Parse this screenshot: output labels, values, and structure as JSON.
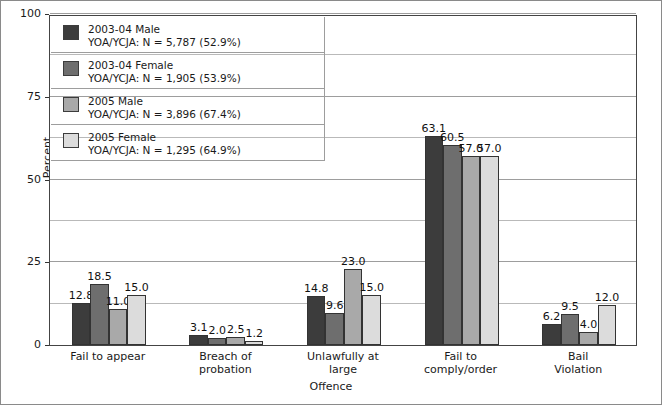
{
  "chart_data": {
    "type": "bar",
    "title": "",
    "xlabel": "Offence",
    "ylabel": "Percent",
    "ylim": [
      0,
      100
    ],
    "yticks": [
      0,
      25,
      50,
      75,
      100
    ],
    "gridlines": [
      12.5,
      25,
      37.5,
      50,
      62.5,
      75,
      87.5,
      100
    ],
    "grid": true,
    "legend_position": "top-left-inside",
    "categories": [
      "Fail to appear",
      "Breach of probation",
      "Unlawfully at large",
      "Fail to comply/order",
      "Bail Violation"
    ],
    "category_lines": [
      [
        "Fail to appear"
      ],
      [
        "Breach of",
        "probation"
      ],
      [
        "Unlawfully at",
        "large"
      ],
      [
        "Fail to",
        "comply/order"
      ],
      [
        "Bail",
        "Violation"
      ]
    ],
    "series": [
      {
        "name": "2003-04 Male",
        "sub": "YOA/YCJA: N = 5,787 (52.9%)",
        "color": "#3c3c3c",
        "values": [
          12.8,
          3.1,
          14.8,
          63.1,
          6.2
        ],
        "labels": [
          "12.8",
          "3.1",
          "14.8",
          "63.1",
          "6.2"
        ]
      },
      {
        "name": "2003-04 Female",
        "sub": "YOA/YCJA: N = 1,905 (53.9%)",
        "color": "#6e6e6e",
        "values": [
          18.5,
          2.0,
          9.6,
          60.5,
          9.5
        ],
        "labels": [
          "18.5",
          "2.0",
          "9.6",
          "60.5",
          "9.5"
        ]
      },
      {
        "name": "2005 Male",
        "sub": "YOA/YCJA: N = 3,896 (67.4%)",
        "color": "#a9a9a9",
        "values": [
          11.0,
          2.5,
          23.0,
          57.0,
          4.0
        ],
        "labels": [
          "11.0",
          "2.5",
          "23.0",
          "57.0",
          "4.0"
        ]
      },
      {
        "name": "2005 Female",
        "sub": "YOA/YCJA: N = 1,295 (64.9%)",
        "color": "#dcdcdc",
        "values": [
          15.0,
          1.2,
          15.0,
          57.0,
          12.0
        ],
        "labels": [
          "15.0",
          "1.2",
          "15.0",
          "57.0",
          "12.0"
        ]
      }
    ]
  },
  "axis": {
    "y_tick_labels": [
      "100",
      "75",
      "50",
      "25",
      "0"
    ],
    "y_title": "Percent",
    "x_title": "Offence"
  }
}
